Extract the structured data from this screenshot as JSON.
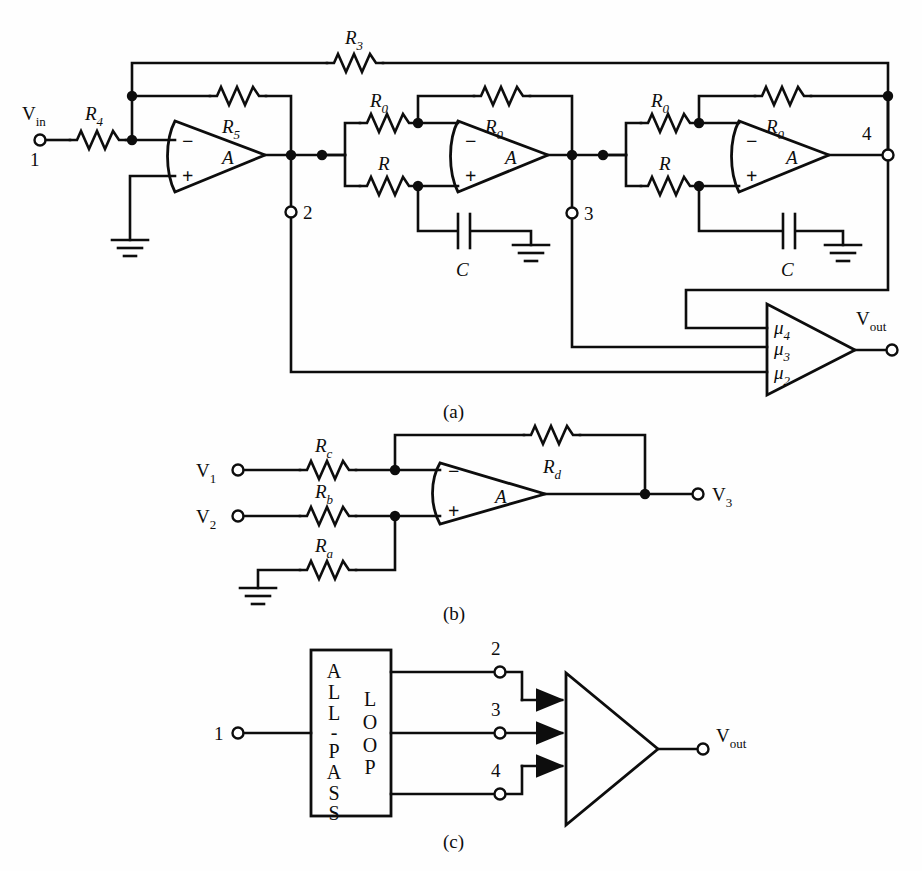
{
  "figure": {
    "type": "schematic-diagram",
    "panels": [
      {
        "id": "a",
        "caption": "(a)",
        "description": "All-pass loop with three op-amp stages and summing amplifier"
      },
      {
        "id": "b",
        "caption": "(b)",
        "description": "Differential summing amplifier"
      },
      {
        "id": "c",
        "caption": "(c)",
        "description": "Block diagram of all-pass loop feeding summer"
      }
    ]
  },
  "panel_a": {
    "caption": "(a)",
    "input_label": "V",
    "input_sub": "in",
    "input_node": "1",
    "output_label": "V",
    "output_sub": "out",
    "resistors": [
      {
        "name": "R",
        "sub": "3"
      },
      {
        "name": "R",
        "sub": "4"
      },
      {
        "name": "R",
        "sub": "5"
      },
      {
        "name": "R",
        "sub": "0"
      },
      {
        "name": "R",
        "sub": "0"
      },
      {
        "name": "R",
        "sub": ""
      },
      {
        "name": "R",
        "sub": "0"
      },
      {
        "name": "R",
        "sub": "0"
      },
      {
        "name": "R",
        "sub": ""
      }
    ],
    "r3_label": "R",
    "r3_sub": "3",
    "r4_label": "R",
    "r4_sub": "4",
    "r5_label": "R",
    "r5_sub": "5",
    "r0_label": "R",
    "r0_sub": "0",
    "r_label": "R",
    "cap_label": "C",
    "opamp_label": "A",
    "minus_sign": "−",
    "plus_sign": "+",
    "nodes": [
      "1",
      "2",
      "3",
      "4"
    ],
    "node1": "1",
    "node2": "2",
    "node3": "3",
    "node4": "4",
    "summer_inputs": [
      {
        "greek": "μ",
        "sub": "4"
      },
      {
        "greek": "μ",
        "sub": "3"
      },
      {
        "greek": "μ",
        "sub": "2"
      }
    ],
    "mu": "μ",
    "mu4_sub": "4",
    "mu3_sub": "3",
    "mu2_sub": "2"
  },
  "panel_b": {
    "caption": "(b)",
    "v1_label": "V",
    "v1_sub": "1",
    "v2_label": "V",
    "v2_sub": "2",
    "v3_label": "V",
    "v3_sub": "3",
    "rc_label": "R",
    "rc_sub": "c",
    "rb_label": "R",
    "rb_sub": "b",
    "ra_label": "R",
    "ra_sub": "a",
    "rd_label": "R",
    "rd_sub": "d",
    "opamp_label": "A",
    "minus_sign": "−",
    "plus_sign": "+"
  },
  "panel_c": {
    "caption": "(c)",
    "block_text_left": "ALL-PASS",
    "block_text_right": "LOOP",
    "block_left_letters": [
      "A",
      "L",
      "L",
      "-",
      "P",
      "A",
      "S",
      "S"
    ],
    "block_right_letters": [
      "L",
      "O",
      "O",
      "P"
    ],
    "input_node": "1",
    "out_nodes": [
      "2",
      "3",
      "4"
    ],
    "node2": "2",
    "node3": "3",
    "node4": "4",
    "output_label": "V",
    "output_sub": "out"
  },
  "colors": {
    "ink": "#0d0d0d",
    "paper": "#fefefe"
  }
}
